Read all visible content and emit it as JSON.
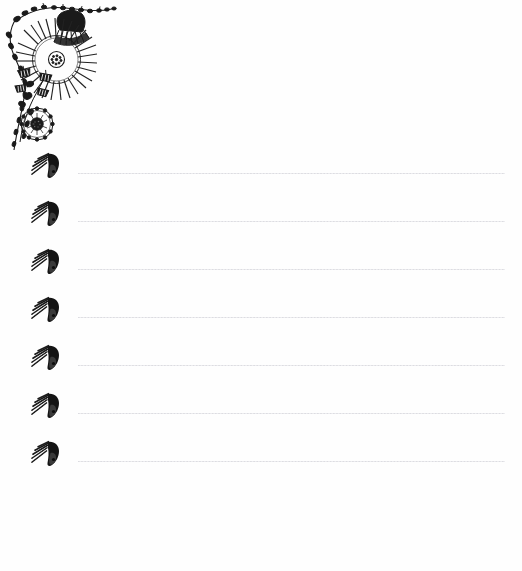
{
  "page": {
    "kind": "decorative-stationery-sheet",
    "width": 522,
    "height": 571,
    "background_color": "#fefefe",
    "ink_color": "#1a1a1a",
    "rule_color": "#d8d8dc"
  },
  "ornament": {
    "corner": {
      "name": "floral-corner-ornament",
      "position": "top-left",
      "description": "black ink floral vine corner motif",
      "elements": [
        "large-radiating-daisy",
        "dark-fan-flower",
        "small-bell-flowers",
        "round-pom-flower",
        "leafy-vine-horizontal",
        "leafy-vine-vertical"
      ]
    },
    "line_marker": {
      "name": "bird-head-ornament",
      "description": "small dark curved bud with diagonal hatch strokes fanning left",
      "count": 7
    }
  },
  "lines": {
    "count": 7,
    "spacing_px": 48,
    "start_x": 78,
    "end_x": 505,
    "style": "dotted",
    "rows": [
      {
        "index": 1,
        "value": "",
        "placeholder": ""
      },
      {
        "index": 2,
        "value": "",
        "placeholder": ""
      },
      {
        "index": 3,
        "value": "",
        "placeholder": ""
      },
      {
        "index": 4,
        "value": "",
        "placeholder": ""
      },
      {
        "index": 5,
        "value": "",
        "placeholder": ""
      },
      {
        "index": 6,
        "value": "",
        "placeholder": ""
      },
      {
        "index": 7,
        "value": "",
        "placeholder": ""
      }
    ]
  }
}
